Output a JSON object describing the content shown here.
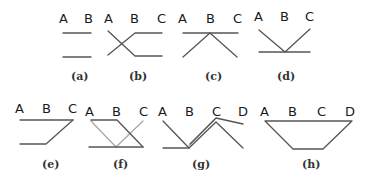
{
  "colors": {
    "line": "#555555",
    "line_light": "#a8a8a8",
    "text": "#1a1a1a",
    "background": "#ffffff"
  },
  "panels": [
    {
      "id": "a",
      "caption": "(a)",
      "labels": [
        "A",
        "B"
      ]
    },
    {
      "id": "b",
      "caption": "(b)",
      "labels": [
        "A",
        "B",
        "C"
      ]
    },
    {
      "id": "c",
      "caption": "(c)",
      "labels": [
        "A",
        "B",
        "C"
      ]
    },
    {
      "id": "d",
      "caption": "(d)",
      "labels": [
        "A",
        "B",
        "C"
      ]
    },
    {
      "id": "e",
      "caption": "(e)",
      "labels": [
        "A",
        "B",
        "C"
      ]
    },
    {
      "id": "f",
      "caption": "(f)",
      "labels": [
        "A",
        "B",
        "C"
      ]
    },
    {
      "id": "g",
      "caption": "(g)",
      "labels": [
        "A",
        "B",
        "C",
        "D"
      ]
    },
    {
      "id": "h",
      "caption": "(h)",
      "labels": [
        "A",
        "B",
        "C",
        "D"
      ]
    }
  ]
}
